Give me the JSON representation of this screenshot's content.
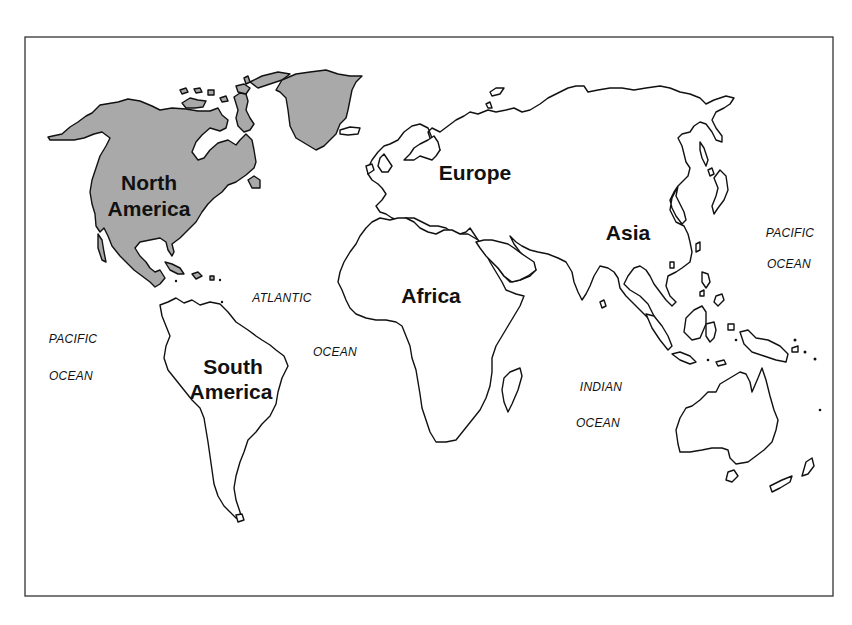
{
  "map": {
    "highlighted_continent": "North America",
    "colors": {
      "highlight_fill": "#a9a9a9",
      "land_fill": "#ffffff",
      "outline": "#111111",
      "frame": "#333333",
      "background": "#ffffff"
    },
    "continents": [
      {
        "id": "north-america",
        "lines": [
          "North",
          "America"
        ],
        "highlighted": true
      },
      {
        "id": "south-america",
        "lines": [
          "South",
          "America"
        ],
        "highlighted": false
      },
      {
        "id": "europe",
        "lines": [
          "Europe"
        ],
        "highlighted": false
      },
      {
        "id": "africa",
        "lines": [
          "Africa"
        ],
        "highlighted": false
      },
      {
        "id": "asia",
        "lines": [
          "Asia"
        ],
        "highlighted": false
      }
    ],
    "oceans": [
      {
        "id": "atlantic",
        "lines": [
          "ATLANTIC",
          "OCEAN"
        ]
      },
      {
        "id": "pacific-west",
        "lines": [
          "PACIFIC",
          "OCEAN"
        ]
      },
      {
        "id": "pacific-east",
        "lines": [
          "PACIFIC",
          "OCEAN"
        ]
      },
      {
        "id": "indian",
        "lines": [
          "INDIAN",
          "OCEAN"
        ]
      }
    ]
  }
}
